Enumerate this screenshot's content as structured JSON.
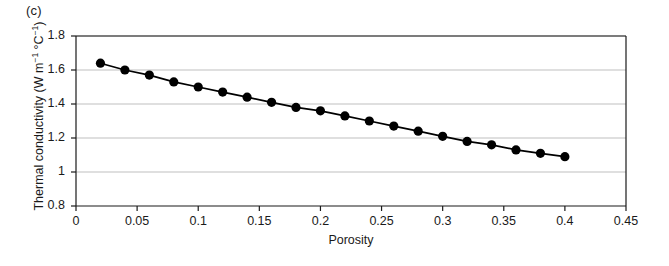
{
  "figure": {
    "panel_label": "(c)",
    "background_color": "#ffffff",
    "axis_color": "#1a1a1a",
    "grid_color": "#bfbfbf",
    "marker_color": "#000000",
    "line_color": "#000000"
  },
  "chart_data": {
    "type": "line",
    "title": "(c)",
    "xlabel": "Porosity",
    "ylabel": "Thermal conductivity (W m⁻¹ °C⁻¹)",
    "ylabel_parts": {
      "prefix": "Thermal conductivity (W m",
      "sup1": "−1",
      "mid": " °C",
      "sup2": "−1",
      "suffix": ")"
    },
    "xlim": [
      0,
      0.45
    ],
    "ylim": [
      0.8,
      1.8
    ],
    "xticks": [
      0,
      0.05,
      0.1,
      0.15,
      0.2,
      0.25,
      0.3,
      0.35,
      0.4,
      0.45
    ],
    "xtick_labels": [
      "0",
      "0.05",
      "0.1",
      "0.15",
      "0.2",
      "0.25",
      "0.3",
      "0.35",
      "0.4",
      "0.45"
    ],
    "yticks": [
      0.8,
      1.0,
      1.2,
      1.4,
      1.6,
      1.8
    ],
    "ytick_labels": [
      "0.8",
      "1",
      "1.2",
      "1.4",
      "1.6",
      "1.8"
    ],
    "grid": "horizontal",
    "legend": "none",
    "marker": "filled-circle",
    "x": [
      0.02,
      0.04,
      0.06,
      0.08,
      0.1,
      0.12,
      0.14,
      0.16,
      0.18,
      0.2,
      0.22,
      0.24,
      0.26,
      0.28,
      0.3,
      0.32,
      0.34,
      0.36,
      0.38,
      0.4
    ],
    "values": [
      1.64,
      1.6,
      1.57,
      1.53,
      1.5,
      1.47,
      1.44,
      1.41,
      1.38,
      1.36,
      1.33,
      1.3,
      1.27,
      1.24,
      1.21,
      1.18,
      1.16,
      1.13,
      1.11,
      1.09
    ]
  }
}
